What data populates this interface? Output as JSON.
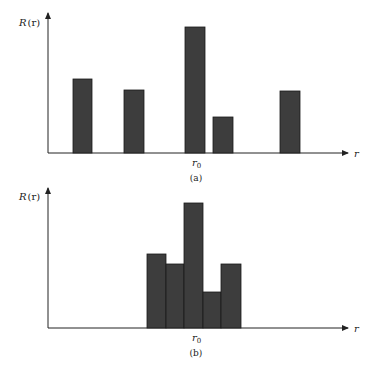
{
  "chart_data": [
    {
      "type": "bar",
      "panel": "a",
      "caption": "(a)",
      "ylabel": "R(r)",
      "xlabel": "r",
      "x_tick_label": "r0",
      "bars": [
        {
          "x_start": 73,
          "x_end": 92,
          "height": 74
        },
        {
          "x_start": 124,
          "x_end": 144,
          "height": 63
        },
        {
          "x_start": 185,
          "x_end": 205,
          "height": 126
        },
        {
          "x_start": 213,
          "x_end": 233,
          "height": 36
        },
        {
          "x_start": 280,
          "x_end": 300,
          "height": 62
        }
      ],
      "values": [
        74,
        63,
        126,
        36,
        62
      ],
      "grid": false,
      "legend": null
    },
    {
      "type": "bar",
      "panel": "b",
      "caption": "(b)",
      "ylabel": "R(r)",
      "xlabel": "r",
      "x_tick_label": "r0",
      "bars": [
        {
          "x_start": 147,
          "x_end": 166,
          "height": 74
        },
        {
          "x_start": 166,
          "x_end": 184,
          "height": 64
        },
        {
          "x_start": 184,
          "x_end": 203,
          "height": 125
        },
        {
          "x_start": 203,
          "x_end": 221,
          "height": 36
        },
        {
          "x_start": 221,
          "x_end": 241,
          "height": 64
        }
      ],
      "values": [
        74,
        64,
        125,
        36,
        64
      ],
      "grid": false,
      "legend": null
    }
  ],
  "panels": {
    "a": {
      "ylabel": "R",
      "ylabel_paren": "(r)",
      "xlabel": "r",
      "tick": "r",
      "tick_sub": "0",
      "caption": "(a)"
    },
    "b": {
      "ylabel": "R",
      "ylabel_paren": "(r)",
      "xlabel": "r",
      "tick": "r",
      "tick_sub": "0",
      "caption": "(b)"
    }
  }
}
